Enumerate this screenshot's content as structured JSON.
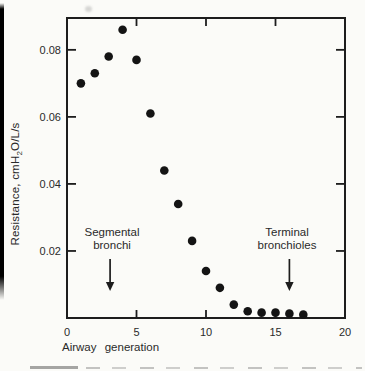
{
  "labels": {
    "xlabel": "Airway generation",
    "ylabel_parts": {
      "pre": "Resistance, cmH",
      "sub": "2",
      "post": "O/L/s"
    }
  },
  "colors": {
    "background": "#fbfbf8",
    "axis": "#1d1d1d",
    "text": "#2a2a2a",
    "marker": "#141414",
    "edge_strip": "#000000"
  },
  "chart_data": {
    "type": "scatter",
    "title": "",
    "xlabel": "Airway generation",
    "ylabel": "Resistance, cmH₂O/L/s",
    "x": [
      1,
      2,
      3,
      4,
      5,
      6,
      7,
      8,
      9,
      10,
      11,
      12,
      13,
      14,
      15,
      16,
      17
    ],
    "y": [
      0.07,
      0.073,
      0.078,
      0.086,
      0.077,
      0.061,
      0.044,
      0.034,
      0.023,
      0.014,
      0.009,
      0.004,
      0.002,
      0.0016,
      0.0016,
      0.0013,
      0.001
    ],
    "xlim": [
      0,
      20
    ],
    "ylim": [
      0,
      0.0895
    ],
    "xticks": [
      0,
      5,
      10,
      15,
      20
    ],
    "xtick_labels": [
      "0",
      "5",
      "10",
      "15",
      "20"
    ],
    "yticks": [
      0.02,
      0.04,
      0.06,
      0.08
    ],
    "ytick_labels": [
      "0.02",
      "0.04",
      "0.06",
      "0.08"
    ],
    "grid": false,
    "frame": "box-with-inward-ticks",
    "legend": "none",
    "marker": "filled-circle",
    "annotations": [
      {
        "id": "segmental-bronchi",
        "lines": [
          "Segmental",
          "bronchi"
        ],
        "arrow_x_gen": 3.1
      },
      {
        "id": "terminal-bronchioles",
        "lines": [
          "Terminal",
          "bronchioles"
        ],
        "arrow_x_gen": 16.0
      }
    ]
  }
}
